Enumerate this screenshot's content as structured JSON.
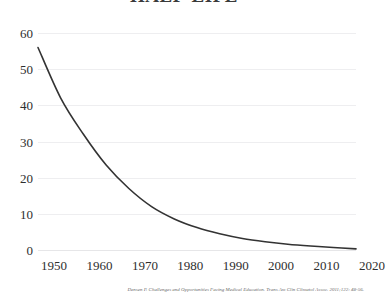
{
  "chart_data": {
    "type": "line",
    "title": "HALF-LIFE",
    "xlabel": "",
    "ylabel": "",
    "xlim": [
      1950,
      2020
    ],
    "ylim": [
      0,
      60
    ],
    "grid": true,
    "legend": null,
    "y_ticks": [
      60,
      50,
      40,
      30,
      20,
      10,
      0
    ],
    "x_ticks": [
      1950,
      1960,
      1970,
      1980,
      1990,
      2000,
      2010,
      2020
    ],
    "series": [
      {
        "name": "Half-life of medical knowledge",
        "color": "#333333",
        "x": [
          1950,
          1955,
          1960,
          1965,
          1970,
          1975,
          1980,
          1985,
          1990,
          1995,
          2000,
          2005,
          2010,
          2015,
          2020
        ],
        "values": [
          56.0,
          42.0,
          32.0,
          23.5,
          17.0,
          12.0,
          8.6,
          6.2,
          4.5,
          3.2,
          2.3,
          1.6,
          1.1,
          0.7,
          0.3
        ]
      }
    ],
    "annotations": []
  },
  "citation": {
    "text": "Densen P. Challenges and Opportunities Facing Medical Education. Trans Am Clin Climatol Assoc. 2011;122: 48-56."
  }
}
